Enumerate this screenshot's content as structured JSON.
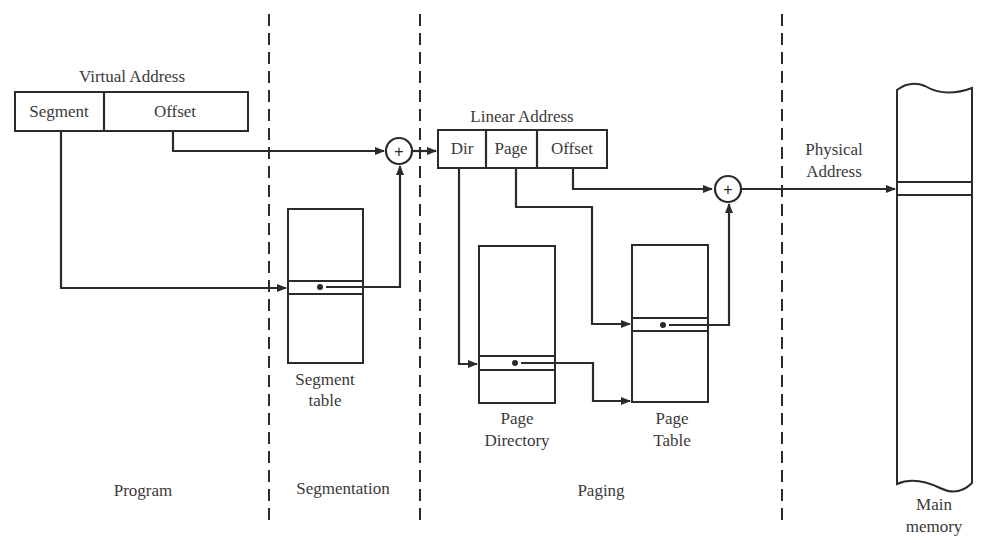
{
  "diagram": {
    "virtual_address": {
      "title": "Virtual Address",
      "fields": [
        "Segment",
        "Offset"
      ]
    },
    "linear_address": {
      "title": "Linear Address",
      "fields": [
        "Dir",
        "Page",
        "Offset"
      ]
    },
    "physical_address": {
      "line1": "Physical",
      "line2": "Address"
    },
    "segment_table": {
      "line1": "Segment",
      "line2": "table"
    },
    "page_directory": {
      "line1": "Page",
      "line2": "Directory"
    },
    "page_table": {
      "line1": "Page",
      "line2": "Table"
    },
    "main_memory": {
      "line1": "Main",
      "line2": "memory"
    },
    "adder_symbol": "+",
    "regions": [
      "Program",
      "Segmentation",
      "Paging"
    ],
    "colors": {
      "ink": "#2b2b2b",
      "text": "#3a3a3a",
      "background": "#ffffff"
    }
  }
}
